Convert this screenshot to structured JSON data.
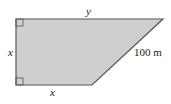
{
  "diagram": {
    "type": "trapezoid",
    "fill_color": "#cfcfcf",
    "stroke_color": "#555555",
    "labels": {
      "top": "y",
      "left": "x",
      "bottom": "x",
      "slant": "100 m"
    },
    "right_angles": [
      "top-left",
      "bottom-left"
    ]
  }
}
